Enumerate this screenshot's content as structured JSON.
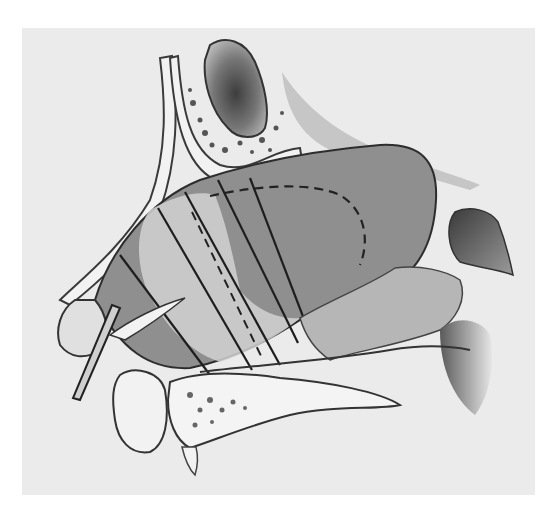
{
  "figure": {
    "kind": "anatomical-illustration",
    "style": "monochrome pencil/halftone drawing",
    "colors": {
      "page": "#ffffff",
      "paper": "#ebebeb",
      "septum_shade": "#8f8f8f",
      "bone": "#f2f2f2",
      "ink": "#2a2a2a",
      "dark_shade": "#555555"
    },
    "elements": [
      "frontal-sinus",
      "nasal-bone",
      "septal-cartilage-region",
      "incision-lines",
      "dashed-outline",
      "posterior-choana-turbinate",
      "sphenoid-region",
      "forceps-clamp",
      "nasal-ala",
      "premaxilla-bone",
      "palate-bone",
      "soft-palate-shadow"
    ]
  }
}
